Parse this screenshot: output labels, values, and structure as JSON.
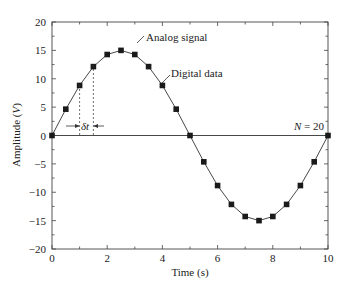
{
  "chart_data": {
    "type": "line",
    "title": "",
    "xlabel": "Time (s)",
    "ylabel": "Amplitude (V)",
    "xlim": [
      0,
      10
    ],
    "ylim": [
      -20,
      20
    ],
    "xticks": [
      0,
      2,
      4,
      6,
      8,
      10
    ],
    "yticks": [
      20,
      15,
      10,
      5,
      0,
      -5,
      -10,
      -15,
      -20
    ],
    "grid": false,
    "series": [
      {
        "name": "Analog signal",
        "style": "line",
        "x": [
          0,
          0.5,
          1,
          1.5,
          2,
          2.5,
          3,
          3.5,
          4,
          4.5,
          5,
          5.5,
          6,
          6.5,
          7,
          7.5,
          8,
          8.5,
          9,
          9.5,
          10
        ],
        "values": [
          0,
          4.64,
          8.82,
          12.14,
          14.27,
          15.0,
          14.27,
          12.14,
          8.82,
          4.64,
          0,
          -4.64,
          -8.82,
          -12.14,
          -14.27,
          -15.0,
          -14.27,
          -12.14,
          -8.82,
          -4.64,
          0
        ]
      },
      {
        "name": "Digital data",
        "style": "square-markers",
        "x": [
          0,
          0.5,
          1,
          1.5,
          2,
          2.5,
          3,
          3.5,
          4,
          4.5,
          5,
          5.5,
          6,
          6.5,
          7,
          7.5,
          8,
          8.5,
          9,
          9.5,
          10
        ],
        "values": [
          0,
          4.64,
          8.82,
          12.14,
          14.27,
          15.0,
          14.27,
          12.14,
          8.82,
          4.64,
          0,
          -4.64,
          -8.82,
          -12.14,
          -14.27,
          -15.0,
          -14.27,
          -12.14,
          -8.82,
          -4.64,
          0
        ]
      }
    ],
    "annotations": [
      {
        "text": "Analog signal",
        "x": 3.3,
        "y": 15.5
      },
      {
        "text": "Digital data",
        "x": 4.1,
        "y": 11.4
      },
      {
        "text": "N = 20",
        "x": 9.1,
        "y": 1.5
      },
      {
        "text": "δt",
        "x": 1.25,
        "y": 0.6
      }
    ]
  },
  "labels": {
    "xlabel": "Time (s)",
    "ylabel_main": "Amplitude (",
    "ylabel_var": "V",
    "ylabel_end": ")",
    "analog": "Analog signal",
    "digital": "Digital data",
    "n_var": "N",
    "n_rest": " = 20",
    "delta": "δt"
  }
}
